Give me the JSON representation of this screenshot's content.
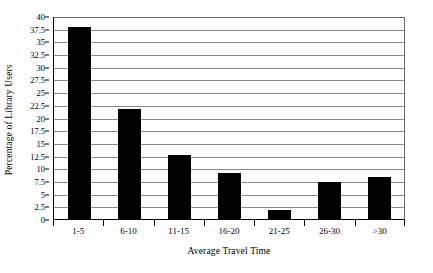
{
  "chart_data": {
    "type": "bar",
    "title": "",
    "subtitle": "",
    "xlabel": "Average Travel Time",
    "ylabel": "Percentage of Library Users",
    "categories": [
      "1-5",
      "6-10",
      "11-15",
      "16-20",
      "21-25",
      "26-30",
      ">30"
    ],
    "values": [
      37.8,
      21.6,
      12.6,
      9.0,
      1.7,
      7.2,
      8.2
    ],
    "ylim": [
      0,
      40
    ],
    "ytick_step": 2.5,
    "yticks": [
      "40",
      "37.5",
      "35",
      "32.5",
      "30",
      "27.5",
      "25",
      "22.5",
      "20",
      "17.5",
      "15",
      "12.5",
      "10",
      "7.5",
      "5",
      "2.5",
      "0"
    ],
    "ytick_values": [
      40,
      37.5,
      35,
      32.5,
      30,
      27.5,
      25,
      22.5,
      20,
      17.5,
      15,
      12.5,
      10,
      7.5,
      5,
      2.5,
      0
    ],
    "grid": "horizontal",
    "legend": "none",
    "bar_color": "#000000",
    "grid_color": "#8a8a8a",
    "axis_color": "#000000",
    "background_color": "#ffffff"
  }
}
